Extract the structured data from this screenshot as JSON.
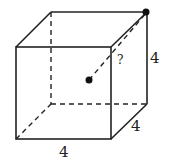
{
  "diagram": {
    "type": "cube",
    "edge_labels": {
      "bottom": "4",
      "depth": "4",
      "height": "4"
    },
    "unknown_label": "?",
    "points": [
      {
        "name": "center",
        "description": "center of cube"
      },
      {
        "name": "corner",
        "description": "top back right vertex"
      }
    ],
    "colors": {
      "line": "#222222",
      "background": "#ffffff"
    }
  }
}
